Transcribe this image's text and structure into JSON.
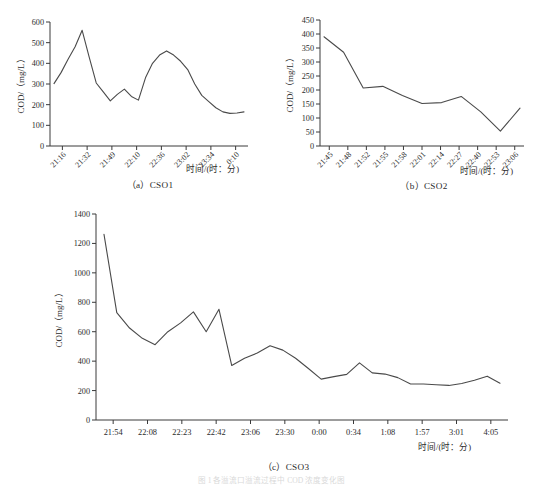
{
  "figure": {
    "caption_faint": "图 1  各溢流口溢流过程中 COD 浓度变化图",
    "axis_title_x": "时间/(时：分)",
    "axis_title_y": "COD/（mg/L）"
  },
  "chart_data": [
    {
      "id": "cso1",
      "type": "line",
      "title": "（a）CSO1",
      "xlabel": "时间/(时：分)",
      "ylabel": "COD/（mg/L）",
      "ylim": [
        0,
        600
      ],
      "yticks": [
        0,
        100,
        200,
        300,
        400,
        500,
        600
      ],
      "grid": false,
      "legend": "none",
      "categories": [
        "21:16",
        "21:32",
        "21:49",
        "22:10",
        "22:36",
        "23:02",
        "23:34",
        "0:10"
      ],
      "x": [
        0,
        1,
        2,
        3,
        4,
        5,
        6,
        7,
        8,
        9,
        10,
        11,
        12,
        13,
        14,
        15,
        16,
        17
      ],
      "values": [
        302,
        355,
        420,
        480,
        560,
        430,
        305,
        262,
        218,
        250,
        275,
        240,
        222,
        330,
        400,
        440,
        460,
        440,
        410,
        370,
        300,
        245,
        215,
        185,
        165,
        158,
        160,
        165
      ]
    },
    {
      "id": "cso2",
      "type": "line",
      "title": "（b）CSO2",
      "xlabel": "时间/(时：分)",
      "ylabel": "COD/（mg/L）",
      "ylim": [
        0,
        450
      ],
      "yticks": [
        0,
        50,
        100,
        150,
        200,
        250,
        300,
        350,
        400,
        450
      ],
      "grid": false,
      "legend": "none",
      "categories": [
        "21:45",
        "21:48",
        "21:52",
        "21:55",
        "21:58",
        "22:01",
        "22:14",
        "22:27",
        "22:40",
        "22:53",
        "23:06"
      ],
      "values": [
        390,
        335,
        207,
        213,
        180,
        152,
        155,
        177,
        122,
        53,
        135
      ]
    },
    {
      "id": "cso3",
      "type": "line",
      "title": "（c）CSO3",
      "xlabel": "时间/(时：分)",
      "ylabel": "COD/（mg/L）",
      "ylim": [
        0,
        1400
      ],
      "yticks": [
        0,
        200,
        400,
        600,
        800,
        1000,
        1200,
        1400
      ],
      "grid": false,
      "legend": "none",
      "categories": [
        "21:54",
        "22:08",
        "22:23",
        "22:42",
        "23:06",
        "23:30",
        "0:00",
        "0:34",
        "1:08",
        "1:57",
        "3:01",
        "4:05"
      ],
      "values": [
        1262,
        730,
        625,
        555,
        512,
        600,
        660,
        735,
        600,
        752,
        370,
        420,
        455,
        505,
        475,
        420,
        350,
        278,
        295,
        310,
        388,
        320,
        312,
        288,
        245,
        245,
        240,
        235,
        248,
        270,
        298,
        250
      ]
    }
  ]
}
